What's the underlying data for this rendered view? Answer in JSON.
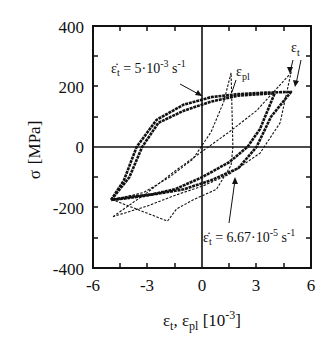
{
  "chart_data": {
    "type": "line",
    "title": "",
    "xlabel": "ε_t, ε_pl [10^-3]",
    "ylabel": "σ [MPa]",
    "xlim": [
      -6,
      6
    ],
    "ylim": [
      -400,
      400
    ],
    "xticks": [
      -6,
      -3,
      0,
      3,
      6
    ],
    "yticks": [
      400,
      200,
      0,
      -200,
      -400
    ],
    "grid": false,
    "zero_lines": true,
    "annotations": [
      {
        "text": "ε̇_t = 5·10^-3 s^-1",
        "points_to": [
          0,
          175
        ]
      },
      {
        "text": "ε_pl",
        "points_to": [
          0.7,
          170
        ]
      },
      {
        "text": "ε_t",
        "points_to": [
          4.9,
          245
        ]
      },
      {
        "text": "ε̇_t = 6.67·10^-5 s^-1",
        "points_to": [
          1.7,
          -50
        ]
      }
    ],
    "series": [
      {
        "name": "fast rate ε̇_t = 5·10^-3 s^-1, σ vs ε_t (dashed)",
        "style": "dashed",
        "x": [
          -4.9,
          -3.0,
          -1.5,
          0.0,
          1.5,
          3.0,
          4.9,
          4.3,
          3.2,
          1.5,
          0.0,
          -1.5,
          -3.0,
          -4.9
        ],
        "y": [
          -230,
          -150,
          -80,
          -15,
          50,
          120,
          245,
          80,
          -20,
          -90,
          -130,
          -160,
          -195,
          -230
        ]
      },
      {
        "name": "fast rate, σ vs ε_pl (dashed)",
        "style": "dashed",
        "x": [
          -4.9,
          -3.2,
          -1.8,
          -0.5,
          0.5,
          1.2,
          1.6,
          1.7,
          1.6,
          0.8,
          -0.5,
          -1.4,
          -1.9
        ],
        "y": [
          -175,
          -150,
          -100,
          -40,
          50,
          150,
          245,
          0,
          -60,
          -140,
          -175,
          -205,
          -245
        ]
      },
      {
        "name": "slow rate ε̇_t = 6.67·10^-5 s^-1, σ vs ε_t (solid markers)",
        "style": "markers",
        "x": [
          -5.0,
          -4.3,
          -3.6,
          -2.5,
          -1.0,
          0.5,
          2.0,
          3.5,
          4.9,
          3.8,
          3.0,
          2.0,
          0.5,
          -1.0,
          -2.5,
          -4.0,
          -5.0
        ],
        "y": [
          -175,
          -110,
          0,
          90,
          140,
          165,
          175,
          180,
          182,
          100,
          0,
          -70,
          -110,
          -140,
          -155,
          -165,
          -175
        ]
      },
      {
        "name": "slow rate, σ vs ε_pl (solid markers)",
        "style": "markers",
        "x": [
          -5.0,
          -4.0,
          -3.3,
          -2.4,
          -1.0,
          0.5,
          2.0,
          3.2,
          4.0,
          3.2,
          2.5,
          1.5,
          0.0,
          -1.5,
          -3.0,
          -4.2
        ],
        "y": [
          -175,
          -100,
          0,
          80,
          120,
          150,
          170,
          175,
          178,
          60,
          0,
          -50,
          -100,
          -140,
          -160,
          -170
        ]
      }
    ]
  },
  "axes": {
    "x_tick_labels": [
      "-6",
      "-3",
      "0",
      "3",
      "6"
    ],
    "y_tick_labels": [
      "400",
      "200",
      "0",
      "-200",
      "-400"
    ],
    "xlabel_eps": "ε",
    "xlabel_sub_t": "t",
    "xlabel_comma": ", ε",
    "xlabel_sub_pl": "pl",
    "xlabel_bracket_open": " [10",
    "xlabel_exp": "-3",
    "xlabel_bracket_close": "]",
    "ylabel_sigma": "σ",
    "ylabel_unit": "[MPa]"
  },
  "labels": {
    "fast_rate_prefix": "ε̇",
    "fast_rate_sub": "t",
    "fast_rate_mid": " = 5·10",
    "fast_rate_exp": "-3",
    "fast_rate_unit": " s",
    "fast_rate_unit_exp": "-1",
    "slow_rate_prefix": "ε̇",
    "slow_rate_sub": "t",
    "slow_rate_mid": " = 6.67·10",
    "slow_rate_exp": "-5",
    "slow_rate_unit": " s",
    "slow_rate_unit_exp": "-1",
    "eps_pl_symbol": "ε",
    "eps_pl_sub": "pl",
    "eps_t_symbol": "ε",
    "eps_t_sub": "t"
  }
}
